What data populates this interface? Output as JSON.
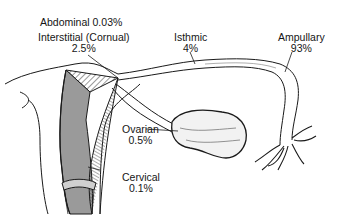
{
  "diagram": {
    "labels": {
      "abdominal": {
        "name": "Abdominal",
        "value": "0.03%",
        "text": "Abdominal 0.03%"
      },
      "interstitial": {
        "name": "Interstitial (Cornual)",
        "value": "2.5%"
      },
      "isthmic": {
        "name": "Isthmic",
        "value": "4%"
      },
      "ampullary": {
        "name": "Ampullary",
        "value": "93%"
      },
      "ovarian": {
        "name": "Ovarian",
        "value": "0.5%"
      },
      "cervical": {
        "name": "Cervical",
        "value": "0.1%"
      }
    },
    "colors": {
      "line": "#1a1a1a",
      "background": "#ffffff",
      "shade": "#8a8a8a"
    }
  }
}
